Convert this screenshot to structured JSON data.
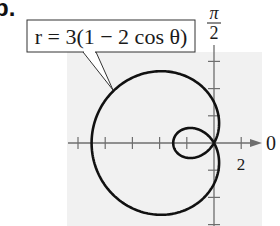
{
  "problem": {
    "label": "b."
  },
  "colors": {
    "background": "#ffffff",
    "plot_area": "#f1f1f1",
    "axis": "#6e6e6e",
    "curve": "#111111",
    "text": "#1a1a1a"
  },
  "chart_data": {
    "type": "line",
    "subtype": "polar",
    "title": "",
    "equation_label": "r = 3(1 − 2 cos θ)",
    "equation": {
      "a": 3,
      "b": 2,
      "form": "r = a(1 - b cos θ)"
    },
    "theta_range": [
      0,
      6.283185
    ],
    "polar_axis_labels": {
      "zero": "0",
      "half_pi": "π/2",
      "half_pi_numerator": "π",
      "half_pi_denominator": "2"
    },
    "tick_labels": [
      {
        "axis": "x",
        "value": 2,
        "text": "2"
      }
    ],
    "tick_spacing": 2,
    "x_ticks": [
      -10,
      -8,
      -6,
      -4,
      -2,
      2
    ],
    "y_ticks": [
      -6,
      -4,
      -2,
      2,
      4,
      6
    ],
    "xlim": [
      -10,
      3.3
    ],
    "ylim": [
      -6,
      6.5
    ],
    "grid": false,
    "legend": null,
    "key_points": [
      {
        "theta": "0",
        "r": -3,
        "x": 3,
        "y": 0
      },
      {
        "theta": "π/3",
        "r": 0,
        "x": 0,
        "y": 0
      },
      {
        "theta": "π/2",
        "r": 3,
        "x": 0,
        "y": 3
      },
      {
        "theta": "π",
        "r": 9,
        "x": -9,
        "y": 0
      },
      {
        "theta": "3π/2",
        "r": 3,
        "x": 0,
        "y": -3
      },
      {
        "theta": "5π/3",
        "r": 0,
        "x": 0,
        "y": 0
      }
    ],
    "inner_loop": {
      "x_range": [
        -1.5,
        0
      ],
      "note": "small inner loop between θ = -π/3 and θ = π/3"
    }
  }
}
